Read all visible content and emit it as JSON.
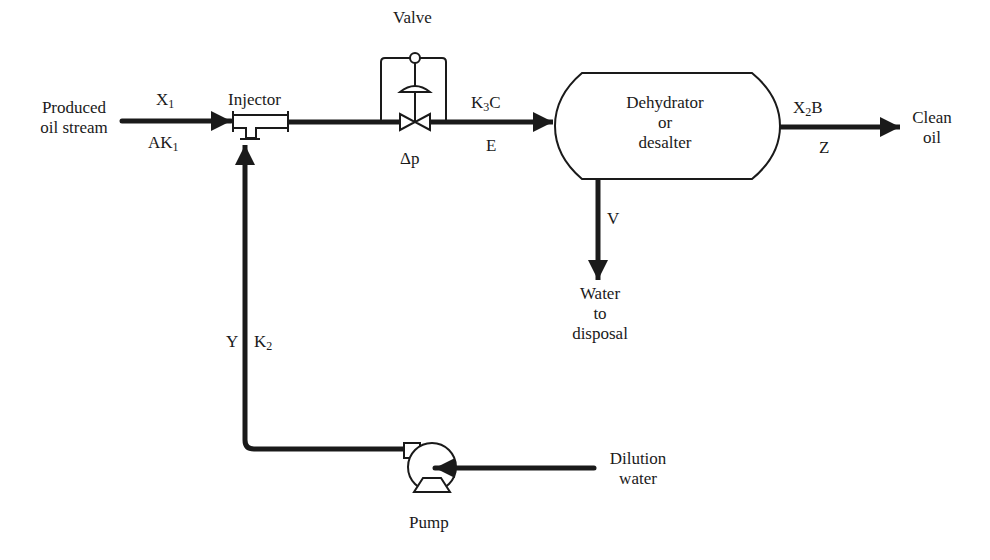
{
  "diagram": {
    "type": "process flow diagram",
    "colors": {
      "line": "#1a1a1a",
      "background": "#ffffff"
    }
  },
  "labels": {
    "produced_oil_line1": "Produced",
    "produced_oil_line2": "oil stream",
    "x1": {
      "base": "X",
      "sub": "1"
    },
    "ak1": {
      "base": "AK",
      "sub": "1"
    },
    "injector": "Injector",
    "valve": "Valve",
    "delta_p": "Δp",
    "k3c": {
      "base": "K",
      "sub": "3",
      "tail": "C"
    },
    "e": "E",
    "dehydrator_line1": "Dehydrator",
    "dehydrator_line2": "or",
    "dehydrator_line3": "desalter",
    "x2b": {
      "base": "X",
      "sub": "2",
      "tail": "B"
    },
    "z": "Z",
    "clean_oil_line1": "Clean",
    "clean_oil_line2": "oil",
    "v": "V",
    "water_line1": "Water",
    "water_line2": "to",
    "water_line3": "disposal",
    "y": "Y",
    "k2": {
      "base": "K",
      "sub": "2"
    },
    "dilution_line1": "Dilution",
    "dilution_line2": "water",
    "pump": "Pump"
  }
}
